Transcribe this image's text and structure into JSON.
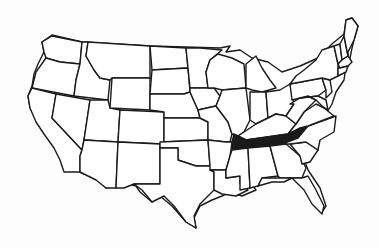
{
  "map": {
    "subject": "United States",
    "highlighted_state": "Tennessee",
    "colors": {
      "background": "#ffffff",
      "outline": "#1a1a1a",
      "highlight": "#1a1a1a"
    }
  }
}
